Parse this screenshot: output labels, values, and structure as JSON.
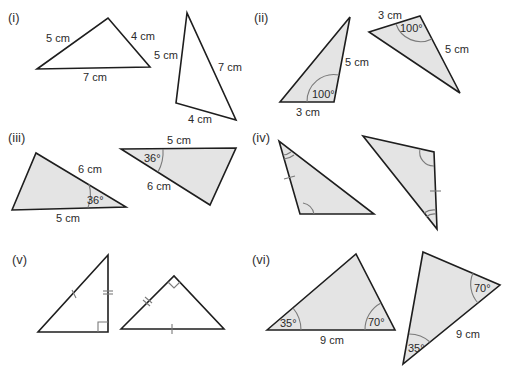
{
  "parts": [
    {
      "id": "i",
      "label": "(i)"
    },
    {
      "id": "ii",
      "label": "(ii)"
    },
    {
      "id": "iii",
      "label": "(iii)"
    },
    {
      "id": "iv",
      "label": "(iv)"
    },
    {
      "id": "v",
      "label": "(v)"
    },
    {
      "id": "vi",
      "label": "(vi)"
    }
  ],
  "triangles": {
    "i_a": {
      "sides": [
        "5 cm",
        "4 cm",
        "7 cm"
      ]
    },
    "i_b": {
      "sides": [
        "5 cm",
        "7 cm",
        "4 cm"
      ]
    },
    "ii_a": {
      "sides": [
        "5 cm",
        "3 cm"
      ],
      "angle": "100°"
    },
    "ii_b": {
      "sides": [
        "3 cm",
        "5 cm"
      ],
      "angle": "100°"
    },
    "iii_a": {
      "sides": [
        "6 cm",
        "5 cm"
      ],
      "angle": "36°"
    },
    "iii_b": {
      "sides": [
        "5 cm",
        "6 cm"
      ],
      "angle": "36°"
    },
    "vi_a": {
      "sides": [
        "9 cm"
      ],
      "angles": [
        "35°",
        "70°"
      ]
    },
    "vi_b": {
      "sides": [
        "9 cm"
      ],
      "angles": [
        "70°",
        "35°"
      ]
    }
  },
  "colors": {
    "shaded_fill": "#e4e4e4",
    "stroke": "#1e1e1e",
    "mark": "#7a7a7a"
  }
}
